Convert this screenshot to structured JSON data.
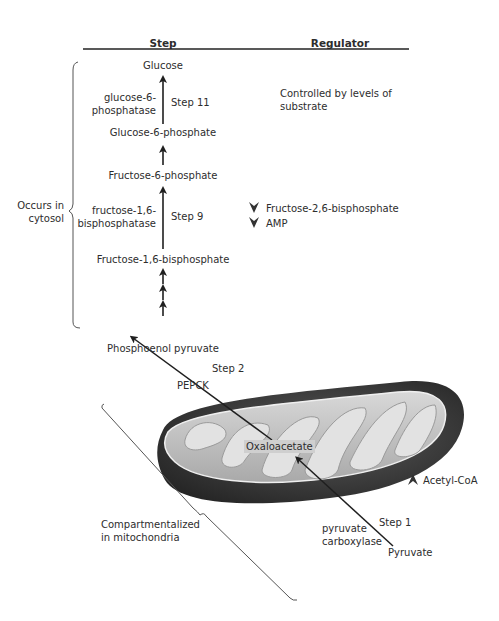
{
  "header": {
    "step_label": "Step",
    "regulator_label": "Regulator"
  },
  "pathway": {
    "metabolites": [
      "Glucose",
      "Glucose-6-phosphate",
      "Fructose-6-phosphate",
      "Fructose-1,6-bisphosphate",
      "Phosphoenol pyruvate"
    ],
    "mito_metabolites": {
      "oxaloacetate": "Oxaloacetate",
      "pyruvate": "Pyruvate"
    },
    "steps": {
      "step11": {
        "label": "Step 11",
        "enzyme_line1": "glucose-6-",
        "enzyme_line2": "phosphatase"
      },
      "step9": {
        "label": "Step 9",
        "enzyme_line1": "fructose-1,6-",
        "enzyme_line2": "bisphosphatase"
      },
      "step2": {
        "label": "Step 2",
        "enzyme": "PEPCK"
      },
      "step1": {
        "label": "Step 1",
        "enzyme_line1": "pyruvate",
        "enzyme_line2": "carboxylase"
      }
    }
  },
  "regulators": {
    "step11": {
      "line1": "Controlled by levels of",
      "line2": "substrate"
    },
    "step9": [
      {
        "icon": "inhibit-chevron-down-icon",
        "label": "Fructose-2,6-bisphosphate"
      },
      {
        "icon": "inhibit-chevron-down-icon",
        "label": "AMP"
      }
    ],
    "step1": {
      "icon": "activate-chevron-up-icon",
      "label": "Acetyl-CoA"
    }
  },
  "compartments": {
    "cytosol": {
      "line1": "Occurs in",
      "line2": "cytosol"
    },
    "mitochondria": {
      "line1": "Compartmentalized",
      "line2": "in mitochondria"
    }
  },
  "colors": {
    "text": "#2d2d2d",
    "arrow": "#1f1f1f",
    "mito_outer": "#3a3a3a",
    "mito_inner": "#c9c9c9",
    "mito_cristae": "#dedede"
  }
}
